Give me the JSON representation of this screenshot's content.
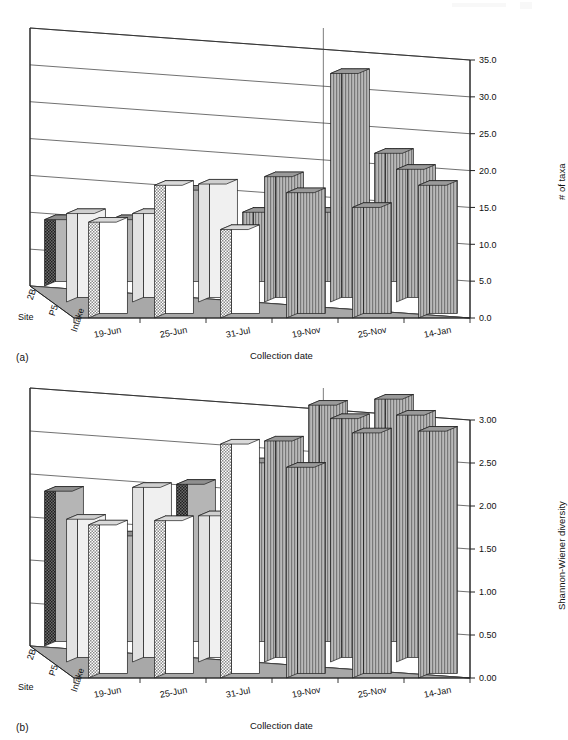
{
  "figure": {
    "background": "#ffffff",
    "ink": "#111111",
    "floor_color": "#a8a8a8",
    "panels": [
      "a",
      "b"
    ]
  },
  "panel_a": {
    "label": "(a)",
    "ylabel": "# of taxa",
    "xlabel": "Collection date",
    "site_axis_title": "Site"
  },
  "panel_b": {
    "label": "(b)",
    "ylabel": "Shannon-Wiener diversity",
    "xlabel": "Collection date",
    "site_axis_title": "Site"
  },
  "chart_data": [
    {
      "type": "bar",
      "panel": "a",
      "title": "",
      "xlabel": "Collection date",
      "ylabel": "# of taxa",
      "zlabel": "Site",
      "projection": "3d",
      "grid": true,
      "legend": "none",
      "ylim": [
        0,
        35
      ],
      "ytick_labels": [
        "0.0",
        "5.0",
        "10.0",
        "15.0",
        "20.0",
        "25.0",
        "30.0",
        "35.0"
      ],
      "yticks": [
        0,
        5,
        10,
        15,
        20,
        25,
        30,
        35
      ],
      "categories": [
        "19-Jun",
        "25-Jun",
        "31-Jul",
        "19-Nov",
        "25-Nov",
        "14-Jan"
      ],
      "series": [
        {
          "name": "Intake",
          "fill": "light-checker",
          "values": [
            13,
            18,
            12,
            17,
            15,
            18
          ]
        },
        {
          "name": "P5",
          "fill": "light-gray",
          "values": [
            12,
            12,
            16,
            17,
            31,
            18
          ]
        },
        {
          "name": "2B",
          "fill": "mid-gray",
          "values": [
            9,
            9,
            13,
            10,
            10,
            18
          ]
        }
      ]
    },
    {
      "type": "bar",
      "panel": "b",
      "title": "",
      "xlabel": "Collection date",
      "ylabel": "Shannon-Wiener diversity",
      "zlabel": "Site",
      "projection": "3d",
      "grid": true,
      "legend": "none",
      "ylim": [
        0,
        3
      ],
      "ytick_labels": [
        "0.00",
        "0.50",
        "1.00",
        "1.50",
        "2.00",
        "2.50",
        "3.00"
      ],
      "yticks": [
        0,
        0.5,
        1.0,
        1.5,
        2.0,
        2.5,
        3.0
      ],
      "categories": [
        "19-Jun",
        "25-Jun",
        "31-Jul",
        "19-Nov",
        "25-Nov",
        "14-Jan"
      ],
      "series": [
        {
          "name": "Intake",
          "fill": "light-checker",
          "values": [
            1.78,
            1.83,
            2.72,
            2.45,
            2.85,
            2.87
          ]
        },
        {
          "name": "P5",
          "fill": "light-gray",
          "values": [
            1.66,
            2.03,
            1.7,
            2.57,
            2.83,
            2.87
          ]
        },
        {
          "name": "2B",
          "fill": "mid-gray",
          "values": [
            1.8,
            1.28,
            1.88,
            2.13,
            2.8,
            2.87
          ]
        }
      ]
    }
  ],
  "site_labels": [
    "Intake",
    "P5",
    "2B"
  ],
  "date_labels": [
    "19-Jun",
    "25-Jun",
    "31-Jul",
    "19-Nov",
    "25-Nov",
    "14-Jan"
  ]
}
